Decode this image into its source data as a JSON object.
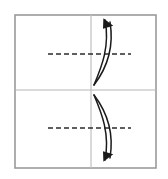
{
  "canvas": {
    "width": 168,
    "height": 179,
    "background": "#ffffff"
  },
  "diagram": {
    "type": "fold-instruction-diagram",
    "title": "",
    "colors": {
      "frame_stroke": "#9a9a9a",
      "divider_stroke": "#b5b5b5",
      "vertical_stroke": "#c0c0c0",
      "fold_line_stroke": "#2b2b2b",
      "arrow_stroke": "#1a1a1a",
      "arrow_fill": "#1a1a1a",
      "background": "#ffffff"
    },
    "outer_frame": {
      "label": "paper-sheet-outline",
      "x": 15,
      "y": 15,
      "width": 141,
      "height": 153,
      "stroke_width": 1.6
    },
    "horizontal_divider": {
      "label": "half-divider-line",
      "x1": 15,
      "y1": 90,
      "x2": 156,
      "y2": 90,
      "stroke_width": 1.2
    },
    "vertical_line": {
      "label": "center-vertical-line",
      "x1": 91,
      "y1": 15,
      "x2": 91,
      "y2": 168,
      "stroke_width": 1.2
    },
    "fold_lines": [
      {
        "label": "upper-fold-crease",
        "x1": 48,
        "y1": 54,
        "x2": 131,
        "y2": 54,
        "dash": "5 3",
        "stroke_width": 1.6
      },
      {
        "label": "lower-fold-crease",
        "x1": 48,
        "y1": 128,
        "x2": 131,
        "y2": 128,
        "dash": "5 3",
        "stroke_width": 1.6
      }
    ],
    "arrows": [
      {
        "label": "upper-fold-arrow",
        "direction": "up",
        "note": "curved lens-shaped double arc bowing right, arrowhead at top pointing up-right",
        "outer_path": "M 94 85 C 102 66 110 46 105 20",
        "inner_path": "M 94 85 C 107 68 114 46 110 22",
        "head_points": "105.0,17.5 112.6,27.2 101.9,27.6",
        "head_rotate": -15,
        "head_cx": 107,
        "head_cy": 24,
        "stroke_width": 1.5
      },
      {
        "label": "lower-fold-arrow",
        "direction": "down",
        "note": "curved lens-shaped double arc bowing right, arrowhead at bottom pointing down-right",
        "outer_path": "M 94 95 C 102 114 110 134 105 160",
        "inner_path": "M 94 95 C 107 112 114 134 110 158",
        "head_points": "105.0,162.5 112.6,152.8 101.9,152.4",
        "head_rotate": 15,
        "head_cx": 107,
        "head_cy": 156,
        "stroke_width": 1.5
      }
    ]
  }
}
